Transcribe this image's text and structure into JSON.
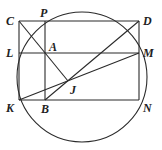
{
  "diagram": {
    "type": "geometry",
    "circle": {
      "cx": 82,
      "cy": 77,
      "r": 65
    },
    "points": {
      "C": {
        "x": 19,
        "y": 21,
        "label": "C"
      },
      "P": {
        "x": 45,
        "y": 21,
        "label": "P"
      },
      "D": {
        "x": 139,
        "y": 21,
        "label": "D"
      },
      "L": {
        "x": 19,
        "y": 53,
        "label": "L"
      },
      "A": {
        "x": 45,
        "y": 53,
        "label": "A"
      },
      "M": {
        "x": 139,
        "y": 53,
        "label": "M"
      },
      "J": {
        "x": 68,
        "y": 81,
        "label": "J"
      },
      "K": {
        "x": 19,
        "y": 100,
        "label": "K"
      },
      "B": {
        "x": 45,
        "y": 100,
        "label": "B"
      },
      "N": {
        "x": 139,
        "y": 100,
        "label": "N"
      }
    },
    "segments": [
      [
        "C",
        "D"
      ],
      [
        "L",
        "M"
      ],
      [
        "K",
        "N"
      ],
      [
        "C",
        "K"
      ],
      [
        "P",
        "B"
      ],
      [
        "D",
        "N"
      ],
      [
        "C",
        "J"
      ],
      [
        "B",
        "D"
      ],
      [
        "K",
        "M"
      ]
    ],
    "colors": {
      "stroke": "#2a2a2a",
      "label": "#1e1e1e",
      "background": "#ffffff"
    }
  }
}
